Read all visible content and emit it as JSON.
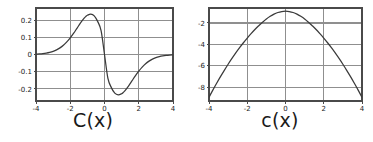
{
  "figure": {
    "background": "#ffffff",
    "panels": [
      {
        "id": "left",
        "caption": "C(x)",
        "frame": {
          "x": 36,
          "y": 8,
          "width": 137,
          "height": 93
        },
        "colors": {
          "frame": "#4a4a4a",
          "grid": "#8f8f8f",
          "curve": "#3a3a3a",
          "tick_text": "#222222"
        },
        "chart_data": {
          "type": "line",
          "title": "C(x)",
          "xlabel": "",
          "ylabel": "",
          "xlim": [
            -4,
            4
          ],
          "ylim": [
            -0.27,
            0.27
          ],
          "grid": true,
          "legend": "none",
          "xticks": [
            -4,
            -2,
            0,
            2,
            4
          ],
          "xticklabels": [
            "-4",
            "-2",
            "0",
            "2",
            "4"
          ],
          "yticks": [
            0.2,
            0.1,
            0,
            -0.1,
            -0.2
          ],
          "yticklabels": [
            "0.2",
            "0.1",
            "0",
            "-0.1",
            "-0.2"
          ],
          "series": [
            {
              "name": "C(x)",
              "x": [
                -4.0,
                -3.8,
                -3.6,
                -3.4,
                -3.2,
                -3.0,
                -2.8,
                -2.6,
                -2.4,
                -2.2,
                -2.0,
                -1.8,
                -1.6,
                -1.4,
                -1.2,
                -1.1,
                -1.0,
                -0.8,
                -0.6,
                -0.4,
                -0.2,
                0.0,
                0.2,
                0.4,
                0.6,
                0.8,
                1.0,
                1.1,
                1.2,
                1.4,
                1.6,
                1.8,
                2.0,
                2.2,
                2.4,
                2.6,
                2.8,
                3.0,
                3.2,
                3.4,
                3.6,
                3.8,
                4.0
              ],
              "y": [
                0.0022,
                0.0035,
                0.0054,
                0.0083,
                0.0125,
                0.0185,
                0.0269,
                0.0384,
                0.0536,
                0.0729,
                0.0965,
                0.1238,
                0.1536,
                0.1833,
                0.2095,
                0.2197,
                0.2276,
                0.2341,
                0.2244,
                0.1923,
                0.1383,
                0.0,
                -0.1383,
                -0.1923,
                -0.2244,
                -0.2341,
                -0.2276,
                -0.2197,
                -0.2095,
                -0.1833,
                -0.1536,
                -0.1238,
                -0.0965,
                -0.0729,
                -0.0536,
                -0.0384,
                -0.0269,
                -0.0185,
                -0.0125,
                -0.0083,
                -0.0054,
                -0.0035,
                -0.0022
              ]
            }
          ]
        }
      },
      {
        "id": "right",
        "caption": "c(x)",
        "frame": {
          "x": 22,
          "y": 8,
          "width": 153,
          "height": 93
        },
        "colors": {
          "frame": "#4a4a4a",
          "grid": "#8f8f8f",
          "curve": "#3a3a3a",
          "tick_text": "#222222"
        },
        "chart_data": {
          "type": "line",
          "title": "c(x)",
          "xlabel": "",
          "ylabel": "",
          "xlim": [
            -4,
            4
          ],
          "ylim": [
            -9.3,
            -0.6
          ],
          "grid": true,
          "legend": "none",
          "xticks": [
            -4,
            -2,
            0,
            2,
            4
          ],
          "xticklabels": [
            "-4",
            "-2",
            "0",
            "2",
            "4"
          ],
          "yticks": [
            -2,
            -4,
            -6,
            -8
          ],
          "yticklabels": [
            "-2",
            "-4",
            "-6",
            "-8"
          ],
          "series": [
            {
              "name": "c(x)",
              "x": [
                -4.0,
                -3.8,
                -3.6,
                -3.4,
                -3.2,
                -3.0,
                -2.8,
                -2.6,
                -2.4,
                -2.2,
                -2.0,
                -1.8,
                -1.6,
                -1.4,
                -1.2,
                -1.0,
                -0.8,
                -0.6,
                -0.4,
                -0.2,
                0.0,
                0.2,
                0.4,
                0.6,
                0.8,
                1.0,
                1.2,
                1.4,
                1.6,
                1.8,
                2.0,
                2.2,
                2.4,
                2.6,
                2.8,
                3.0,
                3.2,
                3.4,
                3.6,
                3.8,
                4.0
              ],
              "y": [
                -8.95,
                -8.28,
                -7.64,
                -7.02,
                -6.43,
                -5.86,
                -5.32,
                -4.8,
                -4.31,
                -3.85,
                -3.41,
                -3.0,
                -2.61,
                -2.26,
                -1.93,
                -1.63,
                -1.38,
                -1.17,
                -1.02,
                -0.93,
                -0.9,
                -0.93,
                -1.02,
                -1.17,
                -1.38,
                -1.63,
                -1.93,
                -2.26,
                -2.61,
                -3.0,
                -3.41,
                -3.85,
                -4.31,
                -4.8,
                -5.32,
                -5.86,
                -6.43,
                -7.02,
                -7.64,
                -8.28,
                -8.95
              ]
            }
          ]
        }
      }
    ]
  }
}
